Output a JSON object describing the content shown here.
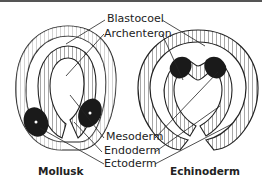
{
  "labels": {
    "blastocoel": "Blastocoel",
    "archenteron": "Archenteron",
    "mesoderm": "Mesoderm",
    "endoderm": "Endoderm",
    "ectoderm": "Ectoderm"
  },
  "captions": {
    "left": "Mollusk",
    "right": "Echinoderm"
  },
  "colors": {
    "line": "#222222",
    "mesoderm_fill": "#1a1a1a",
    "background": "#ffffff"
  }
}
